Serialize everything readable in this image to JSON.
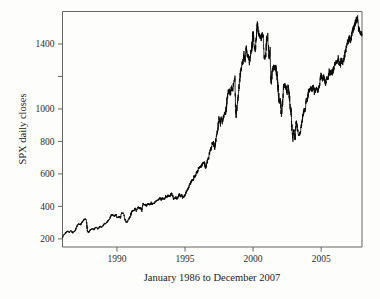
{
  "figure": {
    "background_color": "#fdfdfb",
    "line_color": "#0a0a0a",
    "axis_color": "#555555",
    "text_color": "#232323"
  },
  "chart_data": {
    "type": "line",
    "title": "",
    "subtitle": "",
    "xlabel": "January 1986 to December 2007",
    "ylabel": "SPX daily closes",
    "xlim": [
      1986.0,
      2008.0
    ],
    "ylim": [
      150,
      1600
    ],
    "grid": false,
    "legend": null,
    "legend_position": "none",
    "xticks": [
      1990,
      1995,
      2000,
      2005
    ],
    "xtick_labels": [
      "1990",
      "1995",
      "2000",
      "2005"
    ],
    "yticks": [
      200,
      400,
      600,
      800,
      1000,
      1200,
      1400
    ],
    "ytick_labels": [
      "200",
      "400",
      "600",
      "800",
      "1000",
      "",
      "1400"
    ],
    "series": [
      {
        "name": "SPX daily closes",
        "color": "#0a0a0a",
        "x": [
          1986.0,
          1986.08,
          1986.17,
          1986.25,
          1986.33,
          1986.42,
          1986.5,
          1986.58,
          1986.67,
          1986.75,
          1986.83,
          1986.92,
          1987.0,
          1987.08,
          1987.17,
          1987.25,
          1987.33,
          1987.42,
          1987.5,
          1987.58,
          1987.67,
          1987.75,
          1987.79,
          1987.83,
          1987.92,
          1988.0,
          1988.08,
          1988.17,
          1988.25,
          1988.33,
          1988.42,
          1988.5,
          1988.58,
          1988.67,
          1988.75,
          1988.83,
          1988.92,
          1989.0,
          1989.08,
          1989.17,
          1989.25,
          1989.33,
          1989.42,
          1989.5,
          1989.58,
          1989.67,
          1989.75,
          1989.83,
          1989.92,
          1990.0,
          1990.08,
          1990.17,
          1990.25,
          1990.33,
          1990.42,
          1990.5,
          1990.58,
          1990.67,
          1990.75,
          1990.83,
          1990.92,
          1991.0,
          1991.08,
          1991.17,
          1991.25,
          1991.33,
          1991.42,
          1991.5,
          1991.58,
          1991.67,
          1991.75,
          1991.83,
          1991.92,
          1992.0,
          1992.08,
          1992.17,
          1992.25,
          1992.33,
          1992.42,
          1992.5,
          1992.58,
          1992.67,
          1992.75,
          1992.83,
          1992.92,
          1993.0,
          1993.08,
          1993.17,
          1993.25,
          1993.33,
          1993.42,
          1993.5,
          1993.58,
          1993.67,
          1993.75,
          1993.83,
          1993.92,
          1994.0,
          1994.08,
          1994.17,
          1994.25,
          1994.33,
          1994.42,
          1994.5,
          1994.58,
          1994.67,
          1994.75,
          1994.83,
          1994.92,
          1995.0,
          1995.08,
          1995.17,
          1995.25,
          1995.33,
          1995.42,
          1995.5,
          1995.58,
          1995.67,
          1995.75,
          1995.83,
          1995.92,
          1996.0,
          1996.08,
          1996.17,
          1996.25,
          1996.33,
          1996.42,
          1996.5,
          1996.58,
          1996.67,
          1996.75,
          1996.83,
          1996.92,
          1997.0,
          1997.08,
          1997.17,
          1997.25,
          1997.33,
          1997.42,
          1997.5,
          1997.58,
          1997.67,
          1997.75,
          1997.83,
          1997.92,
          1998.0,
          1998.08,
          1998.17,
          1998.25,
          1998.33,
          1998.42,
          1998.5,
          1998.58,
          1998.67,
          1998.71,
          1998.75,
          1998.83,
          1998.92,
          1999.0,
          1999.08,
          1999.17,
          1999.25,
          1999.33,
          1999.42,
          1999.5,
          1999.58,
          1999.67,
          1999.75,
          1999.83,
          1999.92,
          2000.0,
          2000.08,
          2000.17,
          2000.25,
          2000.29,
          2000.33,
          2000.42,
          2000.5,
          2000.58,
          2000.67,
          2000.75,
          2000.83,
          2000.92,
          2001.0,
          2001.08,
          2001.17,
          2001.25,
          2001.33,
          2001.42,
          2001.5,
          2001.58,
          2001.67,
          2001.71,
          2001.75,
          2001.83,
          2001.92,
          2002.0,
          2002.08,
          2002.17,
          2002.25,
          2002.33,
          2002.42,
          2002.5,
          2002.58,
          2002.67,
          2002.75,
          2002.79,
          2002.83,
          2002.92,
          2003.0,
          2003.08,
          2003.17,
          2003.25,
          2003.33,
          2003.42,
          2003.5,
          2003.58,
          2003.67,
          2003.75,
          2003.83,
          2003.92,
          2004.0,
          2004.08,
          2004.17,
          2004.25,
          2004.33,
          2004.42,
          2004.5,
          2004.58,
          2004.67,
          2004.75,
          2004.83,
          2004.92,
          2005.0,
          2005.08,
          2005.17,
          2005.25,
          2005.33,
          2005.42,
          2005.5,
          2005.58,
          2005.67,
          2005.75,
          2005.83,
          2005.92,
          2006.0,
          2006.08,
          2006.17,
          2006.25,
          2006.33,
          2006.42,
          2006.5,
          2006.58,
          2006.67,
          2006.75,
          2006.83,
          2006.92,
          2007.0,
          2007.08,
          2007.17,
          2007.25,
          2007.33,
          2007.42,
          2007.5,
          2007.58,
          2007.67,
          2007.75,
          2007.83,
          2007.92,
          2008.0
        ],
        "y": [
          211,
          224,
          232,
          238,
          245,
          248,
          240,
          252,
          248,
          237,
          245,
          248,
          264,
          281,
          292,
          289,
          288,
          301,
          310,
          318,
          322,
          318,
          282,
          248,
          240,
          250,
          258,
          262,
          261,
          256,
          271,
          272,
          262,
          266,
          278,
          272,
          277,
          285,
          294,
          294,
          301,
          309,
          317,
          331,
          346,
          349,
          341,
          340,
          353,
          330,
          331,
          339,
          330,
          361,
          358,
          356,
          322,
          306,
          304,
          315,
          330,
          343,
          367,
          375,
          375,
          389,
          371,
          387,
          395,
          387,
          392,
          375,
          417,
          408,
          412,
          403,
          414,
          415,
          408,
          424,
          414,
          418,
          418,
          431,
          436,
          438,
          443,
          451,
          440,
          450,
          448,
          448,
          463,
          458,
          467,
          462,
          466,
          481,
          467,
          445,
          450,
          457,
          444,
          458,
          475,
          462,
          472,
          453,
          459,
          470,
          487,
          500,
          514,
          533,
          545,
          562,
          562,
          584,
          582,
          605,
          615,
          636,
          640,
          645,
          654,
          669,
          670,
          639,
          652,
          687,
          705,
          740,
          757,
          786,
          790,
          757,
          801,
          848,
          885,
          954,
          899,
          947,
          914,
          955,
          970,
          980,
          1049,
          1101,
          1112,
          1094,
          1133,
          1121,
          1157,
          1183,
          1020,
          957,
          1017,
          1098,
          1163,
          1229,
          1279,
          1286,
          1335,
          1302,
          1372,
          1328,
          1320,
          1282,
          1336,
          1389,
          1469,
          1394,
          1366,
          1452,
          1498,
          1527,
          1452,
          1452,
          1430,
          1455,
          1430,
          1315,
          1320,
          1436,
          1429,
          1315,
          1366,
          1160,
          1239,
          1260,
          1249,
          1255,
          1224,
          1211,
          1133,
          1041,
          1059,
          965,
          1040,
          1139,
          1148,
          1130,
          1107,
          1147,
          1076,
          990,
          990,
          911,
          815,
          885,
          815,
          936,
          879,
          841,
          848,
          864,
          916,
          964,
          990,
          996,
          1050,
          1058,
          1112,
          1112,
          1132,
          1114,
          1140,
          1101,
          1114,
          1130,
          1114,
          1130,
          1174,
          1211,
          1181,
          1203,
          1181,
          1156,
          1191,
          1191,
          1234,
          1220,
          1228,
          1220,
          1249,
          1280,
          1280,
          1294,
          1311,
          1280,
          1270,
          1310,
          1280,
          1303,
          1336,
          1377,
          1400,
          1418,
          1438,
          1420,
          1455,
          1482,
          1503,
          1526,
          1549,
          1553,
          1497,
          1473,
          1468,
          1462
        ]
      }
    ],
    "annotations": [
      {
        "label": "1987 peak",
        "approx_value": 335,
        "approx_year": 1987.6
      },
      {
        "label": "1987 crash low",
        "approx_value": 225,
        "approx_year": 1987.83
      },
      {
        "label": "1994 plateau",
        "approx_value": 450,
        "approx_year": 1994.3
      },
      {
        "label": "1998 correction low",
        "approx_value": 957,
        "approx_year": 1998.75
      },
      {
        "label": "dot-com peak",
        "approx_value": 1527,
        "approx_year": 2000.25
      },
      {
        "label": "bear market low",
        "approx_value": 815,
        "approx_year": 2002.79
      },
      {
        "label": "2007 peak",
        "approx_value": 1553,
        "approx_year": 2007.75
      },
      {
        "label": "series end",
        "approx_value": 1462,
        "approx_year": 2008.0
      }
    ]
  }
}
